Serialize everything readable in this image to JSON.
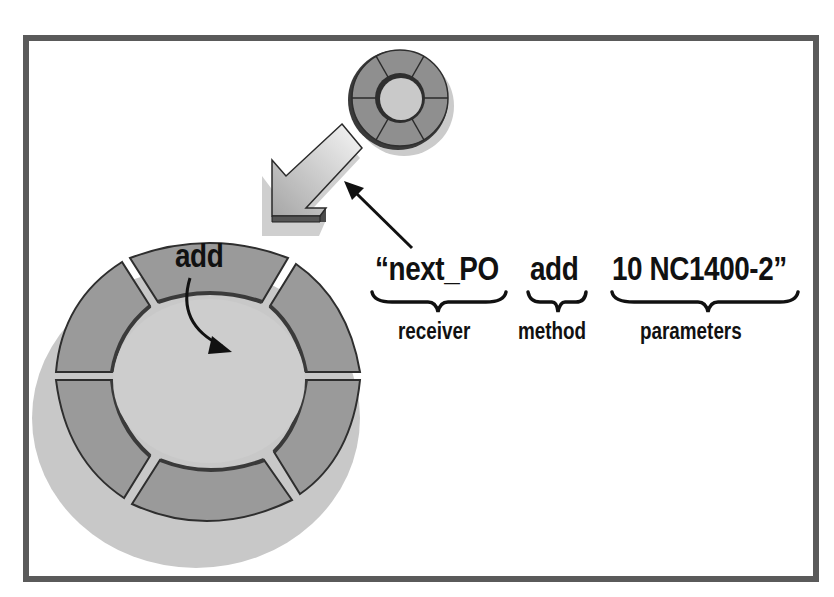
{
  "diagram": {
    "message": {
      "receiver_text": "“next_PO",
      "method_text": "add",
      "parameters_text": "10  NC1400-2”"
    },
    "braces": {
      "receiver_label": "receiver",
      "method_label": "method",
      "parameters_label": "parameters"
    },
    "receiver_object": {
      "method_segment_label": "add",
      "segments": 6
    },
    "sender_object": {
      "segments": 6
    },
    "colors": {
      "frame": "#5a5a5a",
      "segment_fill": "#9a9a9a",
      "segment_edge": "#3a3a3a",
      "center_fill": "#cfcfcf",
      "shadow": "#c4c4c4",
      "arrow_light": "#f4f4f4",
      "arrow_dark": "#a8a8a8",
      "text": "#111111"
    }
  }
}
